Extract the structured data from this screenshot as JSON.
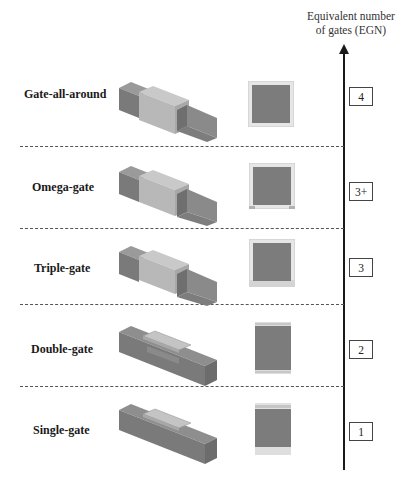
{
  "axis": {
    "title_line1": "Equivalent number",
    "title_line2": "of gates (EGN)"
  },
  "rows": [
    {
      "label": "Gate-all-around",
      "egn": "4",
      "gate_sides": "all"
    },
    {
      "label": "Omega-gate",
      "egn": "3+",
      "gate_sides": "omega"
    },
    {
      "label": "Triple-gate",
      "egn": "3",
      "gate_sides": "triple"
    },
    {
      "label": "Double-gate",
      "egn": "2",
      "gate_sides": "double"
    },
    {
      "label": "Single-gate",
      "egn": "1",
      "gate_sides": "single"
    }
  ],
  "colors": {
    "silicon": "#7f7f7f",
    "silicon_dark": "#6b6b6b",
    "gate": "#b4b4b4",
    "gate_light": "#cfcfcf",
    "oxide": "#dcdcdc",
    "axis": "#1a1a1a"
  }
}
